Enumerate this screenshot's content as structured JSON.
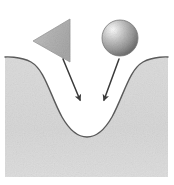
{
  "figure": {
    "title": "Objects falling into a potential well",
    "caption": "A triangle and a sphere above a curved valley, with arrows indicating motion toward the basin",
    "width": 174,
    "height": 185,
    "background_color": "#ffffff"
  },
  "colors": {
    "background": "#ffffff",
    "terrain_fill": "#d9d9d9",
    "terrain_fill_light": "#e6e6e6",
    "terrain_outline": "#5a5a5a",
    "triangle_fill": "#b5b5b5",
    "triangle_outline": "#8c8c8c",
    "sphere_highlight": "#f2f2f2",
    "sphere_mid": "#b0b0b0",
    "sphere_shadow": "#6e6e6e",
    "arrow_color": "#3a3a3a"
  },
  "terrain": {
    "name": "valley-surface",
    "label": "Curved valley surface",
    "plateau_left_y": 57,
    "plateau_right_y": 57,
    "basin_center_x": 87,
    "basin_bottom_y": 133,
    "left_edge_x": 5,
    "right_edge_x": 168,
    "bottom_edge_y": 177,
    "outline_width": 1.4
  },
  "objects": [
    {
      "name": "triangle-object",
      "shape": "triangle",
      "label": "Triangle",
      "points": "70,19 70,62 33,41",
      "centroid_x": 57,
      "centroid_y": 40
    },
    {
      "name": "sphere-object",
      "shape": "sphere",
      "label": "Sphere",
      "center_x": 120,
      "center_y": 38,
      "radius": 18,
      "highlight_x": 112,
      "highlight_y": 29
    }
  ],
  "arrows": [
    {
      "name": "arrow-from-triangle",
      "label": "Arrow from triangle to basin",
      "x1": 63,
      "y1": 59,
      "x2": 80,
      "y2": 100,
      "tip_x": 80,
      "tip_y": 107
    },
    {
      "name": "arrow-from-sphere",
      "label": "Arrow from sphere to basin",
      "x1": 119,
      "y1": 59,
      "x2": 104,
      "y2": 100,
      "tip_x": 104,
      "tip_y": 107
    }
  ]
}
